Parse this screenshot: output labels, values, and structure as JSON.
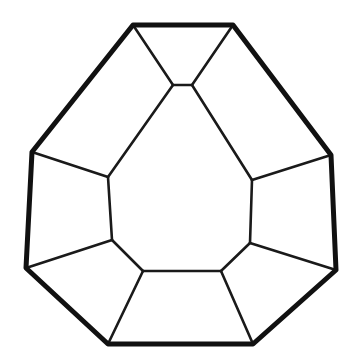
{
  "figure": {
    "canvas": {
      "width": 354,
      "height": 360,
      "background_color": "#ffffff"
    },
    "style": {
      "outline_color": "#111111",
      "inner_edge_color": "#1a1a1a",
      "face_fill_color": "#ffffff",
      "outline_stroke_width": 5,
      "inner_stroke_width": 2.6
    },
    "counts": {
      "visible_faces": 10,
      "outer_vertices": 8,
      "inner_vertices": 8
    },
    "vertices": {
      "outer": [
        {
          "name": "top-left",
          "x": 133,
          "y": 25
        },
        {
          "name": "top-right",
          "x": 233,
          "y": 25
        },
        {
          "name": "right-upper",
          "x": 331,
          "y": 155
        },
        {
          "name": "right-lower",
          "x": 336,
          "y": 270
        },
        {
          "name": "bottom-right",
          "x": 253,
          "y": 344
        },
        {
          "name": "bottom-left",
          "x": 108,
          "y": 344
        },
        {
          "name": "left-lower",
          "x": 26,
          "y": 268
        },
        {
          "name": "left-upper",
          "x": 32,
          "y": 152
        }
      ],
      "inner": [
        {
          "name": "apex-left",
          "x": 173,
          "y": 85
        },
        {
          "name": "apex-right",
          "x": 192,
          "y": 85
        },
        {
          "name": "right-top",
          "x": 252,
          "y": 180
        },
        {
          "name": "right-bottom",
          "x": 250,
          "y": 243
        },
        {
          "name": "bottom-right",
          "x": 221,
          "y": 271
        },
        {
          "name": "bottom-left",
          "x": 143,
          "y": 271
        },
        {
          "name": "left-bottom",
          "x": 112,
          "y": 240
        },
        {
          "name": "left-top",
          "x": 108,
          "y": 177
        }
      ]
    },
    "faces": [
      {
        "name": "central-face",
        "label": "central large face",
        "points": "173,85 192,85 252,180 250,243 221,271 143,271 112,240 108,177"
      },
      {
        "name": "top-face",
        "label": "top small face",
        "points": "133,25 233,25 192,85 173,85"
      },
      {
        "name": "upper-left-face",
        "label": "upper left facet",
        "points": "32,152 133,25 173,85 108,177"
      },
      {
        "name": "upper-right-face",
        "label": "upper right facet",
        "points": "233,25 331,155 252,180 192,85"
      },
      {
        "name": "left-face",
        "label": "left facet",
        "points": "32,152 108,177 112,240 26,268"
      },
      {
        "name": "right-face",
        "label": "right facet",
        "points": "252,180 331,155 336,270 250,243"
      },
      {
        "name": "lower-left-face",
        "label": "lower left facet",
        "points": "26,268 112,240 143,271 108,344"
      },
      {
        "name": "lower-right-face",
        "label": "lower right facet",
        "points": "221,271 250,243 336,270 253,344"
      },
      {
        "name": "bottom-face",
        "label": "bottom facet",
        "points": "143,271 221,271 253,344 108,344"
      }
    ],
    "outline_path": "M133,25 L233,25 L331,155 L336,270 L253,344 L108,344 L26,268 L32,152 Z",
    "inner_edges": [
      {
        "name": "edge-apexleft-topleft",
        "x1": 173,
        "y1": 85,
        "x2": 133,
        "y2": 25
      },
      {
        "name": "edge-apexright-topright",
        "x1": 192,
        "y1": 85,
        "x2": 233,
        "y2": 25
      },
      {
        "name": "edge-apexleft-apexright",
        "x1": 173,
        "y1": 85,
        "x2": 192,
        "y2": 85
      },
      {
        "name": "edge-apexleft-lefttop",
        "x1": 173,
        "y1": 85,
        "x2": 108,
        "y2": 177
      },
      {
        "name": "edge-apexright-righttop",
        "x1": 192,
        "y1": 85,
        "x2": 252,
        "y2": 180
      },
      {
        "name": "edge-lefttop-leftupper",
        "x1": 108,
        "y1": 177,
        "x2": 32,
        "y2": 152
      },
      {
        "name": "edge-lefttop-leftbottom",
        "x1": 108,
        "y1": 177,
        "x2": 112,
        "y2": 240
      },
      {
        "name": "edge-leftbottom-leftlower",
        "x1": 112,
        "y1": 240,
        "x2": 26,
        "y2": 268
      },
      {
        "name": "edge-leftbottom-bottomleft",
        "x1": 112,
        "y1": 240,
        "x2": 143,
        "y2": 271
      },
      {
        "name": "edge-bottomleft-bottomright",
        "x1": 143,
        "y1": 271,
        "x2": 221,
        "y2": 271
      },
      {
        "name": "edge-bottomleft-outerbottomleft",
        "x1": 143,
        "y1": 271,
        "x2": 108,
        "y2": 344
      },
      {
        "name": "edge-bottomright-outerbottomright",
        "x1": 221,
        "y1": 271,
        "x2": 253,
        "y2": 344
      },
      {
        "name": "edge-bottomright-rightbottom",
        "x1": 221,
        "y1": 271,
        "x2": 250,
        "y2": 243
      },
      {
        "name": "edge-rightbottom-rightlower",
        "x1": 250,
        "y1": 243,
        "x2": 336,
        "y2": 270
      },
      {
        "name": "edge-rightbottom-righttop",
        "x1": 250,
        "y1": 243,
        "x2": 252,
        "y2": 180
      },
      {
        "name": "edge-righttop-rightupper",
        "x1": 252,
        "y1": 180,
        "x2": 331,
        "y2": 155
      }
    ]
  }
}
